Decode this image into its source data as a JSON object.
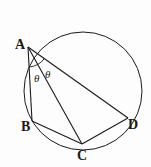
{
  "diagram": {
    "type": "circle-geometry",
    "circle": {
      "cx": 83,
      "cy": 91,
      "r": 59
    },
    "points": {
      "A": {
        "label": "A",
        "x": 28,
        "y": 47
      },
      "B": {
        "label": "B",
        "x": 32,
        "y": 121
      },
      "C": {
        "label": "C",
        "x": 82,
        "y": 144
      },
      "D": {
        "label": "D",
        "x": 128,
        "y": 118
      }
    },
    "segments": [
      "AB",
      "AC",
      "AD",
      "BC",
      "CD"
    ],
    "angles": [
      {
        "vertex": "A",
        "between": [
          "B",
          "C"
        ],
        "label": "θ"
      },
      {
        "vertex": "A",
        "between": [
          "C",
          "D"
        ],
        "label": "θ"
      }
    ],
    "colors": {
      "stroke": "#1a1a1a",
      "background": "#fdfdfd"
    }
  }
}
